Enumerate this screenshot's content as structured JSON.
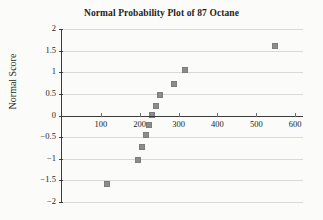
{
  "chart_data": {
    "type": "scatter",
    "title": "Normal Probability Plot of 87 Octane",
    "xlabel": "",
    "ylabel": "Normal Score",
    "xlim": [
      0,
      620
    ],
    "ylim": [
      -2,
      2
    ],
    "grid": true,
    "legend": false,
    "marker_color": "#8c8c8c",
    "axis_color": "#3b3b3b",
    "gridline_color": "#d9d9d6",
    "background_color": "#fbfbfa",
    "x_ticks": [
      100,
      200,
      300,
      400,
      500,
      600
    ],
    "x_tick_labels": [
      "100",
      "200",
      "300",
      "400",
      "500",
      "600"
    ],
    "y_ticks": [
      2,
      1.5,
      1,
      0.5,
      0,
      -0.5,
      -1,
      -1.5,
      -2
    ],
    "y_tick_labels": [
      "2",
      "1.5",
      "1",
      "0.5",
      "0",
      "−0.5",
      "−1",
      "−1.5",
      "−2"
    ],
    "points": [
      {
        "x": 116,
        "y": -1.59
      },
      {
        "x": 196,
        "y": -1.04
      },
      {
        "x": 207,
        "y": -0.72
      },
      {
        "x": 216,
        "y": -0.46
      },
      {
        "x": 224,
        "y": -0.22
      },
      {
        "x": 232,
        "y": 0.01
      },
      {
        "x": 241,
        "y": 0.23
      },
      {
        "x": 252,
        "y": 0.47
      },
      {
        "x": 288,
        "y": 0.73
      },
      {
        "x": 316,
        "y": 1.05
      },
      {
        "x": 548,
        "y": 1.6
      }
    ]
  }
}
